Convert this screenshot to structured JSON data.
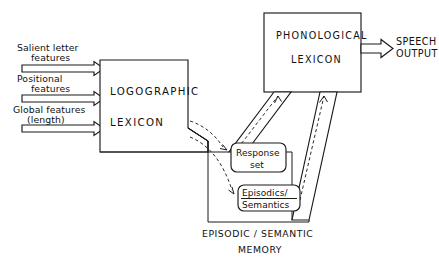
{
  "figure": {
    "type": "cognitive-model-block-diagram",
    "title_caption": "EPISODIC / SEMANTIC",
    "title_caption_line2": "MEMORY"
  },
  "inputs": [
    {
      "id": "salient",
      "line1": "Salient letter",
      "line2": "features"
    },
    {
      "id": "positional",
      "line1": "Positional",
      "line2": "features"
    },
    {
      "id": "global",
      "line1": "Global features",
      "line2": "(length)"
    }
  ],
  "boxes": {
    "logographic": {
      "line1": "LOGOGRAPHIC",
      "line2": "LEXICON"
    },
    "phonological": {
      "line1": "PHONOLOGICAL",
      "line2": "LEXICON"
    },
    "response_set": {
      "line1": "Response",
      "line2": "set"
    },
    "episodics": {
      "line1": "Episodics/",
      "line2": "Semantics"
    }
  },
  "outputs": {
    "speech": {
      "line1": "SPEECH",
      "line2": "OUTPUT"
    }
  },
  "memory_region": {
    "caption_line1": "EPISODIC / SEMANTIC",
    "caption_line2": "MEMORY"
  },
  "colors": {
    "ink": "#1a1a1a",
    "paper": "#ffffff",
    "dashed": "#2a2a2a"
  }
}
